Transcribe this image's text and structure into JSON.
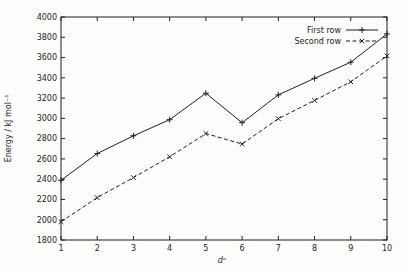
{
  "figure": {
    "background": "#fdfdfc",
    "ink_color": "#1f1f1f"
  },
  "chart_data": {
    "type": "line",
    "title": "",
    "xlabel": "dⁿ",
    "ylabel": "Energy / kJ mol⁻¹",
    "xlim": [
      1,
      10
    ],
    "ylim": [
      1800,
      4000
    ],
    "xtick_step": 1,
    "ytick_step": 200,
    "xticks": [
      1,
      2,
      3,
      4,
      5,
      6,
      7,
      8,
      9,
      10
    ],
    "yticks": [
      1800,
      2000,
      2200,
      2400,
      2600,
      2800,
      3000,
      3200,
      3400,
      3600,
      3800,
      4000
    ],
    "grid": false,
    "legend_position": "top-right-inside",
    "x": [
      1,
      2,
      3,
      4,
      5,
      6,
      7,
      8,
      9,
      10
    ],
    "series": [
      {
        "name": "First row",
        "marker": "plus",
        "line_style": "solid",
        "color": "#1f1f1f",
        "values": [
          2389,
          2653,
          2828,
          2987,
          3248,
          2957,
          3232,
          3395,
          3554,
          3833
        ]
      },
      {
        "name": "Second row",
        "marker": "cross",
        "line_style": "dashed",
        "color": "#1f1f1f",
        "values": [
          1980,
          2218,
          2416,
          2621,
          2850,
          2747,
          2997,
          3177,
          3361,
          3616
        ]
      }
    ]
  }
}
